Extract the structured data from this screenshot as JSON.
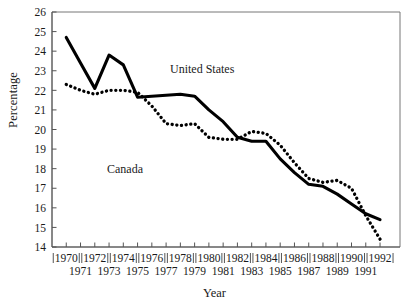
{
  "chart_data": {
    "type": "line",
    "title": "",
    "xlabel": "Year",
    "ylabel": "Percentage",
    "xlim": [
      1969.0,
      1993.4
    ],
    "ylim": [
      14,
      26
    ],
    "ytick_values": [
      14,
      15,
      16,
      17,
      18,
      19,
      20,
      21,
      22,
      23,
      24,
      25,
      26
    ],
    "ytick_labels": [
      "14",
      "15",
      "16",
      "17",
      "18",
      "19",
      "20",
      "21",
      "22",
      "23",
      "24",
      "25",
      "26"
    ],
    "grid": false,
    "legend_position": "inline-annotations",
    "x": [
      1970,
      1971,
      1972,
      1973,
      1974,
      1975,
      1976,
      1977,
      1978,
      1979,
      1980,
      1981,
      1982,
      1983,
      1984,
      1985,
      1986,
      1987,
      1988,
      1989,
      1990,
      1991,
      1992
    ],
    "xtick_labels_upper": [
      "1970",
      "",
      "1972",
      "",
      "1974",
      "",
      "1976",
      "",
      "1978",
      "",
      "1980",
      "",
      "1982",
      "",
      "1984",
      "",
      "1986",
      "",
      "1988",
      "",
      "1990",
      "",
      "1992"
    ],
    "xtick_labels_lower": [
      "",
      "1971",
      "",
      "1973",
      "",
      "1975",
      "",
      "1977",
      "",
      "1979",
      "",
      "1981",
      "",
      "1983",
      "",
      "1985",
      "",
      "1987",
      "",
      "1989",
      "",
      "1991",
      ""
    ],
    "series": [
      {
        "name": "United States",
        "style": "solid",
        "color": "#000000",
        "values": [
          24.7,
          23.4,
          22.1,
          23.8,
          23.3,
          21.65,
          21.7,
          21.75,
          21.8,
          21.7,
          21.0,
          20.4,
          19.6,
          19.4,
          19.4,
          18.5,
          17.8,
          17.2,
          17.1,
          16.7,
          16.2,
          15.7,
          15.4
        ]
      },
      {
        "name": "Canada",
        "style": "dotted",
        "color": "#000000",
        "values": [
          22.3,
          22.0,
          21.8,
          22.0,
          22.0,
          21.9,
          21.2,
          20.3,
          20.2,
          20.3,
          19.6,
          19.5,
          19.5,
          19.9,
          19.8,
          19.2,
          18.3,
          17.5,
          17.3,
          17.4,
          17.0,
          15.6,
          14.4
        ]
      }
    ],
    "annotations": [
      {
        "text": "United States",
        "series": "United States"
      },
      {
        "text": "Canada",
        "series": "Canada"
      }
    ]
  }
}
